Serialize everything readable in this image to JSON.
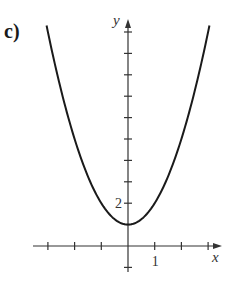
{
  "panel_label": "c)",
  "chart_data": {
    "type": "line",
    "title": "",
    "function": "y = x^2 + 1",
    "xlabel": "x",
    "ylabel": "y",
    "xlim": [
      -3.5,
      3.5
    ],
    "ylim": [
      -1,
      10.5
    ],
    "x_ticks": [
      -3,
      -2,
      -1,
      1,
      2,
      3
    ],
    "y_ticks": [
      -1,
      1,
      2,
      3,
      4,
      5,
      6,
      7,
      8,
      9,
      10
    ],
    "tick_labels": {
      "x": [
        {
          "value": 1,
          "label": "1"
        }
      ],
      "y": [
        {
          "value": 2,
          "label": "2"
        }
      ]
    },
    "grid": false,
    "legend": null,
    "series": [
      {
        "name": "curve",
        "x": [
          -3,
          -2.5,
          -2,
          -1.5,
          -1,
          -0.5,
          0,
          0.5,
          1,
          1.5,
          2,
          2.5,
          3
        ],
        "y": [
          10,
          7.25,
          5,
          3.25,
          2,
          1.25,
          1,
          1.25,
          2,
          3.25,
          5,
          7.25,
          10
        ]
      }
    ]
  },
  "colors": {
    "axis": "#333333",
    "curve": "#1a1a1a"
  }
}
